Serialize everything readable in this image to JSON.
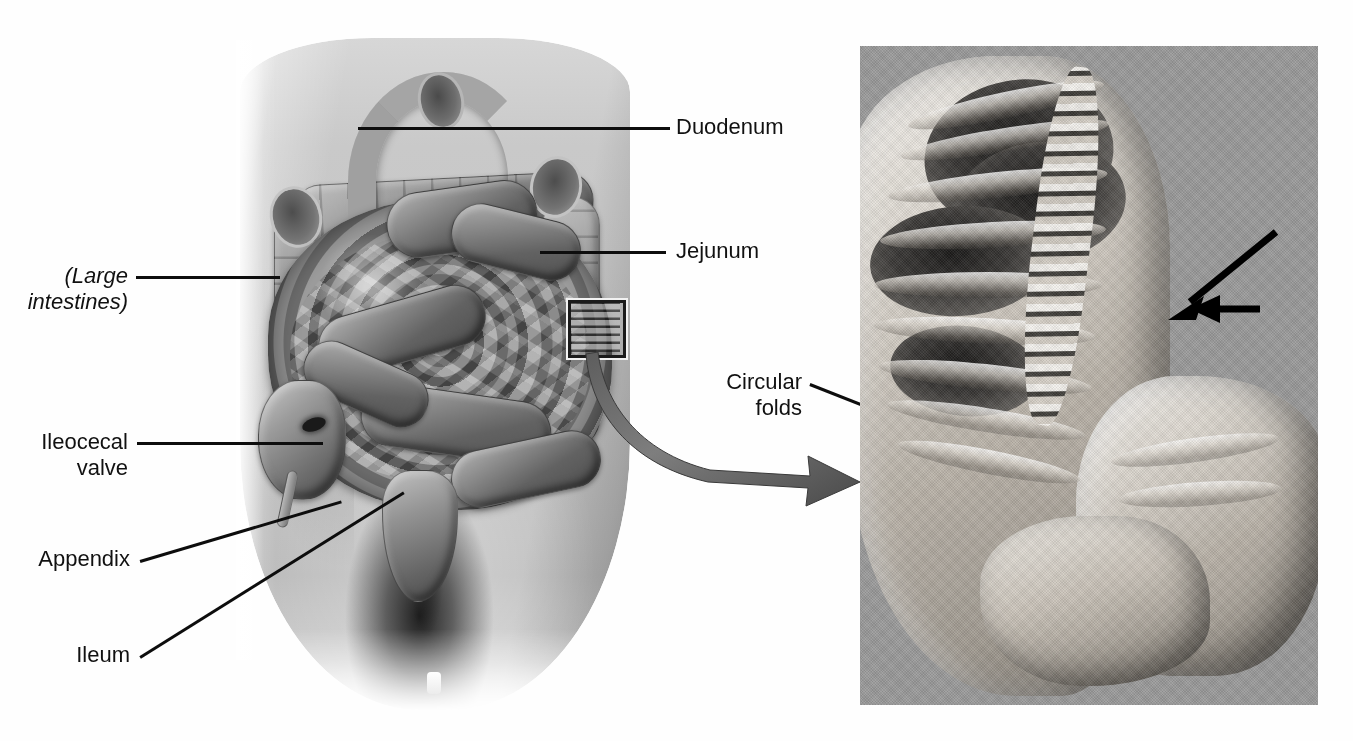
{
  "figure": {
    "kind": "anatomy-figure",
    "panels": [
      "small-intestine-illustration",
      "circular-folds-photograph"
    ]
  },
  "labels": {
    "duodenum": "Duodenum",
    "jejunum": "Jejunum",
    "large_intestines": "(Large\nintestines)",
    "ileocecal_valve": "Ileocecal\nvalve",
    "appendix": "Appendix",
    "ileum": "Ileum",
    "circular_folds": "Circular\nfolds"
  },
  "icons": {
    "zoom_box": "magnified-region-box",
    "swoosh": "curved-magnification-arrow",
    "photo_arrow_large": "pointer-arrow-down-left",
    "photo_arrow_small": "pointer-arrow-left"
  },
  "colors": {
    "page_background": "#fefefe",
    "photo_background": "#9a9a9a",
    "leader_line": "#0d0d0d",
    "label_text": "#111111",
    "illustration_tissue": "#8c8c8c",
    "specimen_tissue": "#ded9d1"
  }
}
